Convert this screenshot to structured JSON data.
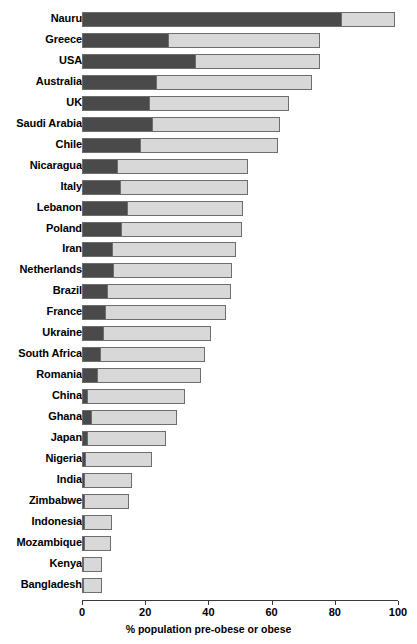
{
  "chart_data": {
    "type": "bar",
    "orientation": "horizontal",
    "stacked": true,
    "title": "",
    "subtitle": "",
    "xlabel": "% population pre-obese or obese",
    "ylabel": "",
    "xlim": [
      0,
      100
    ],
    "xticks": [
      0,
      20,
      40,
      60,
      80,
      100
    ],
    "xtick_labels": [
      "0",
      "20",
      "40",
      "60",
      "80",
      "100"
    ],
    "grid": false,
    "legend": null,
    "colors": {
      "dark_segment": "#4a4a4a",
      "light_segment": "#d8d8d8",
      "bar_outline": "#6d6d6d",
      "axis": "#3a3a3a",
      "background": "#ffffff",
      "text": "#000000"
    },
    "categories": [
      "Nauru",
      "Greece",
      "USA",
      "Australia",
      "UK",
      "Saudi Arabia",
      "Chile",
      "Nicaragua",
      "Italy",
      "Lebanon",
      "Poland",
      "Iran",
      "Netherlands",
      "Brazil",
      "France",
      "Ukraine",
      "South Africa",
      "Romania",
      "China",
      "Ghana",
      "Japan",
      "Nigeria",
      "India",
      "Zimbabwe",
      "Indonesia",
      "Mozambique",
      "Kenya",
      "Bangladesh"
    ],
    "series": [
      {
        "name": "obese",
        "color": "#4a4a4a",
        "values": [
          82.5,
          27.6,
          36.2,
          23.5,
          21.3,
          22.5,
          18.4,
          11.1,
          12.1,
          14.3,
          12.4,
          9.5,
          9.8,
          7.9,
          7.3,
          6.7,
          5.7,
          4.8,
          1.5,
          2.9,
          1.6,
          1.0,
          0.8,
          0.7,
          0.6,
          0.6,
          0.4,
          0.4
        ]
      },
      {
        "name": "pre-obese",
        "color": "#d8d8d8",
        "values": [
          16.5,
          47.6,
          39.0,
          49.2,
          44.1,
          40.0,
          43.6,
          41.3,
          40.3,
          36.5,
          38.1,
          39.1,
          37.8,
          39.4,
          38.4,
          34.2,
          33.3,
          32.7,
          31.2,
          27.3,
          25.1,
          21.2,
          15.1,
          14.2,
          8.9,
          8.6,
          5.9,
          5.9
        ]
      }
    ],
    "totals": [
      99.0,
      75.2,
      75.2,
      72.7,
      65.4,
      62.5,
      62.0,
      52.4,
      52.4,
      50.8,
      50.5,
      48.6,
      47.6,
      47.3,
      45.7,
      40.9,
      39.0,
      37.5,
      32.7,
      30.2,
      26.7,
      22.2,
      15.9,
      14.9,
      9.5,
      9.2,
      6.3,
      6.3
    ]
  }
}
